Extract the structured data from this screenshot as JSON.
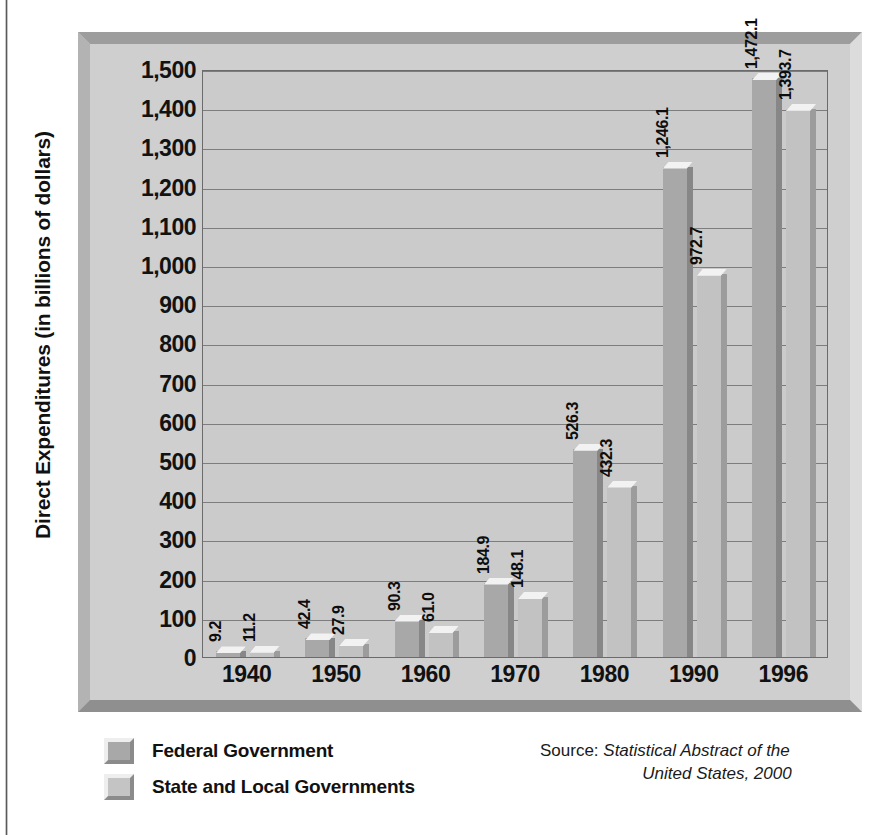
{
  "chart_data": {
    "type": "bar",
    "title": "",
    "xlabel": "",
    "ylabel": "Direct Expenditures (in billions of dollars)",
    "categories": [
      "1940",
      "1950",
      "1960",
      "1970",
      "1980",
      "1990",
      "1996"
    ],
    "series": [
      {
        "name": "Federal Government",
        "color": "#a8a8a8",
        "values": [
          9.2,
          42.4,
          90.3,
          184.9,
          526.3,
          1246.1,
          1472.1
        ],
        "labels": [
          "9.2",
          "42.4",
          "90.3",
          "184.9",
          "526.3",
          "1,246.1",
          "1,472.1"
        ]
      },
      {
        "name": "State and Local Governments",
        "color": "#c2c2c2",
        "values": [
          11.2,
          27.9,
          61.0,
          148.1,
          432.3,
          972.7,
          1393.7
        ],
        "labels": [
          "11.2",
          "27.9",
          "61.0",
          "148.1",
          "432.3",
          "972.7",
          "1,393.7"
        ]
      }
    ],
    "ylim": [
      0,
      1500
    ],
    "ytick_values": [
      0,
      100,
      200,
      300,
      400,
      500,
      600,
      700,
      800,
      900,
      1000,
      1100,
      1200,
      1300,
      1400,
      1500
    ],
    "ytick_labels": [
      "0",
      "100",
      "200",
      "300",
      "400",
      "500",
      "600",
      "700",
      "800",
      "900",
      "1,000",
      "1,100",
      "1,200",
      "1,300",
      "1,400",
      "1,500"
    ],
    "grid": true,
    "legend_position": "bottom-left"
  },
  "legend": {
    "items": [
      {
        "label": "Federal Government",
        "swatch": "federal"
      },
      {
        "label": "State and Local Governments",
        "swatch": "state"
      }
    ]
  },
  "source": {
    "label": "Source: ",
    "title_line1": "Statistical Abstract of the",
    "title_line2": "United States, 2000"
  }
}
